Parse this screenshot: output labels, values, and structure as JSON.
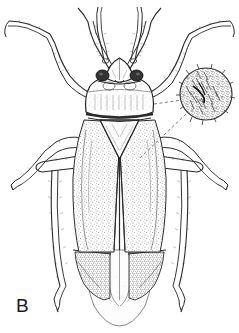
{
  "figure": {
    "panel_label": "B",
    "technique": "stipple-pen-and-ink-scientific-illustration",
    "background_color": "#ffffff",
    "ink_color": "#2b2b2b",
    "canvas": {
      "width": 239,
      "height": 333
    }
  },
  "specimen": {
    "orientation": "dorsal view",
    "parts": [
      {
        "name": "head",
        "label": "head"
      },
      {
        "name": "compound-eye-left",
        "label": "left compound eye"
      },
      {
        "name": "compound-eye-right",
        "label": "right compound eye"
      },
      {
        "name": "antenna-left",
        "label": "left antenna"
      },
      {
        "name": "antenna-right",
        "label": "right antenna"
      },
      {
        "name": "pronotum",
        "label": "pronotum"
      },
      {
        "name": "scutellum",
        "label": "scutellum"
      },
      {
        "name": "clavus",
        "label": "clavus"
      },
      {
        "name": "corium-left",
        "label": "left corium"
      },
      {
        "name": "corium-right",
        "label": "right corium"
      },
      {
        "name": "cuneus-left",
        "label": "left cuneus"
      },
      {
        "name": "cuneus-right",
        "label": "right cuneus"
      },
      {
        "name": "membrane",
        "label": "hemelytral membrane"
      },
      {
        "name": "foreleg-left",
        "label": "left foreleg"
      },
      {
        "name": "foreleg-right",
        "label": "right foreleg"
      },
      {
        "name": "midleg-left",
        "label": "left midleg"
      },
      {
        "name": "midleg-right",
        "label": "right midleg"
      },
      {
        "name": "hindleg-left",
        "label": "left hindleg"
      },
      {
        "name": "hindleg-right",
        "label": "right hindleg"
      }
    ]
  },
  "inset": {
    "name": "pubescence-detail-circle",
    "description": "circular magnified detail of dorsal pubescence and setae",
    "center": {
      "x": 206,
      "y": 94
    },
    "radius": 26,
    "leader_lines": 2,
    "leader_style": "dashed"
  }
}
